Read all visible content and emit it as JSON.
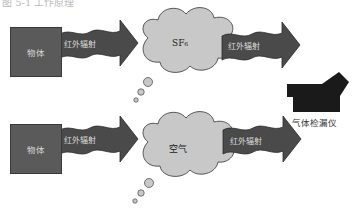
{
  "header": {
    "cut_text": "图 5-1 工作原理"
  },
  "rows": [
    {
      "object_label": "物体",
      "arrow1_label": "红外辐射",
      "gas_label": "SF₆",
      "arrow2_label": "红外辐射"
    },
    {
      "object_label": "物体",
      "arrow1_label": "红外辐射",
      "gas_label": "空气",
      "arrow2_label": "红外辐射"
    }
  ],
  "detector": {
    "label": "气体检漏仪",
    "icon": "camera-icon"
  },
  "colors": {
    "object_box": "#5a5a5a",
    "arrow": "#4a4a4a",
    "cloud": "#c8c8c8",
    "detector": "#1a1a1a"
  }
}
